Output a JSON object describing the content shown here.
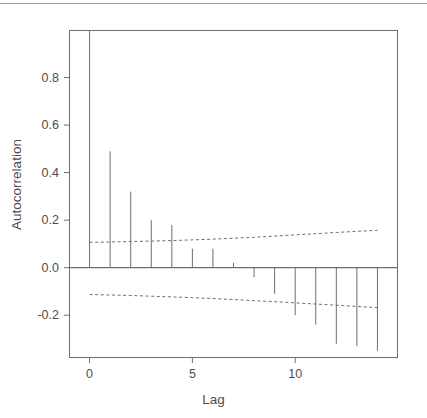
{
  "chart_data": {
    "type": "bar",
    "title": "",
    "subtitle": "",
    "xlabel": "Lag",
    "ylabel": "Autocorrelation",
    "x": [
      0,
      1,
      2,
      3,
      4,
      5,
      6,
      7,
      8,
      9,
      10,
      11,
      12,
      13,
      14
    ],
    "categories": [
      "0",
      "1",
      "2",
      "3",
      "4",
      "5",
      "6",
      "7",
      "8",
      "9",
      "10",
      "11",
      "12",
      "13",
      "14"
    ],
    "values": [
      1.0,
      0.49,
      0.32,
      0.2,
      0.18,
      0.08,
      0.08,
      0.02,
      -0.04,
      -0.11,
      -0.2,
      -0.24,
      -0.32,
      -0.33,
      -0.35
    ],
    "series": [
      {
        "name": "Autocorrelation",
        "values": [
          1.0,
          0.49,
          0.32,
          0.2,
          0.18,
          0.08,
          0.08,
          0.02,
          -0.04,
          -0.11,
          -0.2,
          -0.24,
          -0.32,
          -0.33,
          -0.35
        ]
      },
      {
        "name": "Upper confidence band",
        "values": [
          0.107,
          0.108,
          0.11,
          0.112,
          0.114,
          0.117,
          0.12,
          0.124,
          0.128,
          0.133,
          0.138,
          0.143,
          0.148,
          0.153,
          0.157
        ]
      },
      {
        "name": "Lower confidence band",
        "values": [
          -0.113,
          -0.115,
          -0.117,
          -0.12,
          -0.123,
          -0.126,
          -0.13,
          -0.134,
          -0.139,
          -0.143,
          -0.148,
          -0.153,
          -0.158,
          -0.163,
          -0.168
        ]
      }
    ],
    "xlim": [
      -1,
      15
    ],
    "ylim": [
      -0.38,
      1.0
    ],
    "xticks": [
      0,
      5,
      10
    ],
    "xticklabels": [
      "0",
      "5",
      "10"
    ],
    "yticks": [
      0.8,
      0.6,
      0.4,
      0.2,
      0.0,
      -0.2
    ],
    "yticklabels": [
      "0.8",
      "0.6",
      "0.4",
      "0.2",
      "0.0",
      "-0.2"
    ],
    "grid": false,
    "legend": "none",
    "zero_line": 0.0,
    "line_color": "#6e6e6e",
    "band_color": "#6e6e6e",
    "axis_color": "#6e6e6e",
    "text_color": "#4d4d4d",
    "background": "#ffffff"
  },
  "axes": {
    "x_title": "Lag",
    "y_title": "Autocorrelation",
    "x_tick_labels": [
      "0",
      "5",
      "10"
    ],
    "y_tick_labels": [
      "0.8",
      "0.6",
      "0.4",
      "0.2",
      "0.0",
      "-0.2"
    ]
  }
}
